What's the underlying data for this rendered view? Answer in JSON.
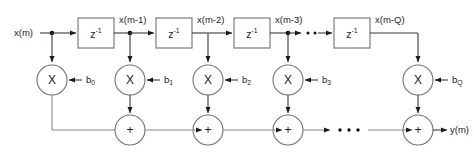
{
  "diagram": {
    "type": "signal-flow-graph",
    "input_label": "x(m)",
    "output_label": "y(m)",
    "delay_glyph": "z",
    "delay_exponent": "-1",
    "multiply_glyph": "X",
    "add_glyph": "+",
    "ellipsis": "···",
    "colors": {
      "background": "#ffffff",
      "wire": "#3a3a3a",
      "wire_light": "#8a8a8a",
      "shape_stroke": "#6f6f6f",
      "shape_fill": "#ffffff",
      "text": "#1a1a1a"
    },
    "taps": [
      {
        "signal": "x(m)",
        "coefficient": "b",
        "subscript": "0"
      },
      {
        "signal": "x(m-1)",
        "coefficient": "b",
        "subscript": "1"
      },
      {
        "signal": "x(m-2)",
        "coefficient": "b",
        "subscript": "2"
      },
      {
        "signal": "x(m-3)",
        "coefficient": "b",
        "subscript": "3"
      },
      {
        "signal": "x(m-Q)",
        "coefficient": "b",
        "subscript": "Q"
      }
    ],
    "signal_labels": [
      "x(m)",
      "x(m-1)",
      "x(m-2)",
      "x(m-3)",
      "x(m-Q)"
    ],
    "coefficient_labels": [
      "b0",
      "b1",
      "b2",
      "b3",
      "bQ"
    ],
    "delay_count": 4,
    "multiplier_count": 5,
    "adder_count": 4
  }
}
